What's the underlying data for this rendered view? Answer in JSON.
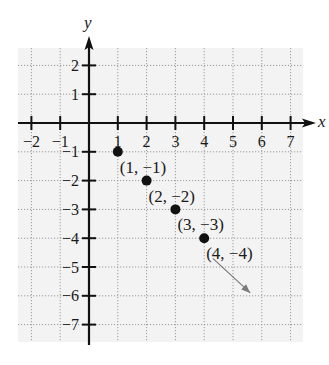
{
  "chart_data": {
    "type": "scatter",
    "title": "",
    "xlabel": "x",
    "ylabel": "y",
    "xlim": [
      -2,
      7
    ],
    "ylim": [
      -7,
      2
    ],
    "grid": true,
    "x_ticks": [
      -2,
      -1,
      1,
      2,
      3,
      4,
      5,
      6,
      7
    ],
    "y_ticks": [
      2,
      1,
      -1,
      -2,
      -3,
      -4,
      -5,
      -6,
      -7
    ],
    "x_tick_labels": [
      "−2",
      "−1",
      "1",
      "2",
      "3",
      "4",
      "5",
      "6",
      "7"
    ],
    "y_tick_labels": [
      "2",
      "1",
      "−1",
      "−2",
      "−3",
      "−4",
      "−5",
      "−6",
      "−7"
    ],
    "points": [
      {
        "x": 1,
        "y": -1,
        "label": "(1, −1)"
      },
      {
        "x": 2,
        "y": -2,
        "label": "(2, −2)"
      },
      {
        "x": 3,
        "y": -3,
        "label": "(3, −3)"
      },
      {
        "x": 4,
        "y": -4,
        "label": "(4, −4)"
      }
    ],
    "annotations": [
      {
        "type": "arrow",
        "from": [
          4.3,
          -4.7
        ],
        "to": [
          5.6,
          -5.9
        ],
        "meaning": "pattern continues"
      }
    ]
  },
  "colors": {
    "axis": "#111111",
    "grid": "#9a9a9a",
    "panel": "#f3f3f3",
    "point": "#111111",
    "arrow": "#7a7a7a"
  }
}
